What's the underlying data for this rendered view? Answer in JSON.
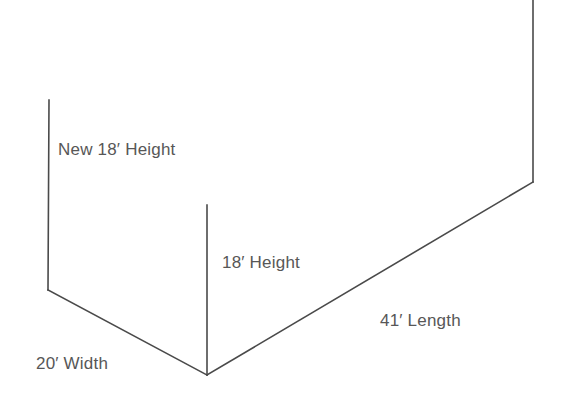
{
  "diagram": {
    "background_color": "#ffffff",
    "line_color": "#4a4a4a",
    "text_color": "#575757",
    "labels": {
      "new_height": "New 18′ Height",
      "height": "18′ Height",
      "length": "41′ Length",
      "width": "20′ Width"
    },
    "measurements": [
      {
        "name": "new-height",
        "value": 18,
        "unit": "feet",
        "text": "New 18′ Height"
      },
      {
        "name": "height",
        "value": 18,
        "unit": "feet",
        "text": "18′ Height"
      },
      {
        "name": "length",
        "value": 41,
        "unit": "feet",
        "text": "41′ Length"
      },
      {
        "name": "width",
        "value": 20,
        "unit": "feet",
        "text": "20′ Width"
      }
    ],
    "edges": {
      "left_vertical": {
        "x1": 49,
        "y1": 100,
        "x2": 48,
        "y2": 290
      },
      "left_diagonal": {
        "x1": 48,
        "y1": 290,
        "x2": 207,
        "y2": 375
      },
      "middle_vertical": {
        "x1": 207,
        "y1": 205,
        "x2": 207,
        "y2": 375
      },
      "right_diagonal": {
        "x1": 207,
        "y1": 375,
        "x2": 533,
        "y2": 182
      },
      "right_vertical": {
        "x1": 533,
        "y1": 182,
        "x2": 533,
        "y2": 0
      }
    },
    "vertex": {
      "x": 207,
      "y": 375
    }
  }
}
